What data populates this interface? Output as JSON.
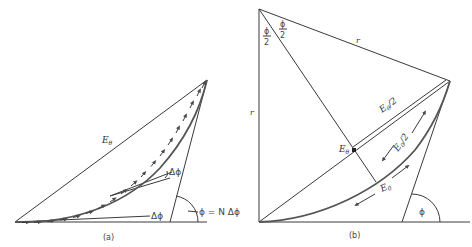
{
  "figure": {
    "panels": [
      {
        "id": "a",
        "caption": "(a)",
        "labels": {
          "resultant": "E",
          "resultant_sub": "θ",
          "delta_top": "Δϕ",
          "delta_bottom": "Δϕ",
          "total_angle": "ϕ = N Δϕ"
        }
      },
      {
        "id": "b",
        "caption": "(b)",
        "labels": {
          "half_angle_left_num": "ϕ",
          "half_angle_left_den": "2",
          "half_angle_right_num": "ϕ",
          "half_angle_right_den": "2",
          "radius_top": "r",
          "radius_left": "r",
          "chord_half": "E",
          "chord_half_sub": "θ",
          "chord_half_suffix": "/2",
          "chord_point": "E",
          "chord_point_sub": "θ",
          "arc_half": "E",
          "arc_half_sub": "0",
          "arc_half_suffix": "/2",
          "arc_full": "E",
          "arc_full_sub": "0",
          "phi": "ϕ"
        }
      }
    ],
    "colors": {
      "line": "#3a3a3a",
      "arc": "#555555",
      "text": "#333333",
      "background": "#ffffff"
    }
  }
}
